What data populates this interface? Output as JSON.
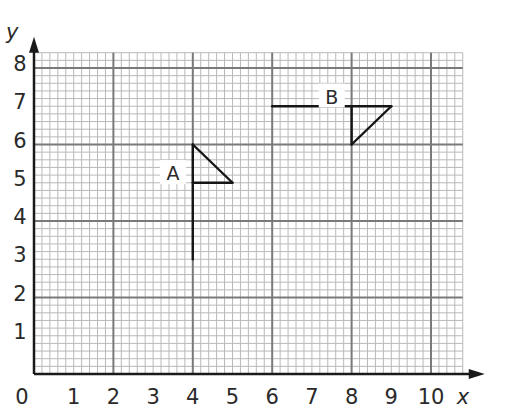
{
  "chart_data": {
    "type": "diagram",
    "title": "",
    "xlabel": "x",
    "ylabel": "y",
    "xlim": [
      0,
      10.8
    ],
    "ylim": [
      0,
      8.4
    ],
    "x_ticks": [
      "0",
      "1",
      "2",
      "3",
      "4",
      "5",
      "6",
      "7",
      "8",
      "9",
      "10"
    ],
    "y_ticks": [
      "1",
      "2",
      "3",
      "4",
      "5",
      "6",
      "7",
      "8"
    ],
    "grid": {
      "on": true,
      "major_every": 2,
      "minor_every": 0.2
    },
    "shapes": [
      {
        "name": "A",
        "label_pos": [
          3.5,
          5.2
        ],
        "segments": [
          [
            [
              4,
              3
            ],
            [
              4,
              6
            ]
          ],
          [
            [
              4,
              6
            ],
            [
              5,
              5
            ]
          ],
          [
            [
              5,
              5
            ],
            [
              4,
              5
            ]
          ]
        ]
      },
      {
        "name": "B",
        "label_pos": [
          7.5,
          7.2
        ],
        "segments": [
          [
            [
              6,
              7
            ],
            [
              9,
              7
            ]
          ],
          [
            [
              8,
              7
            ],
            [
              8,
              6
            ]
          ],
          [
            [
              8,
              6
            ],
            [
              9,
              7
            ]
          ]
        ]
      }
    ],
    "colors": {
      "major_grid": "#7a7a7a",
      "minor_grid": "#b9b9b9",
      "axes": "#1a1a1a",
      "shapes": "#151515"
    }
  }
}
